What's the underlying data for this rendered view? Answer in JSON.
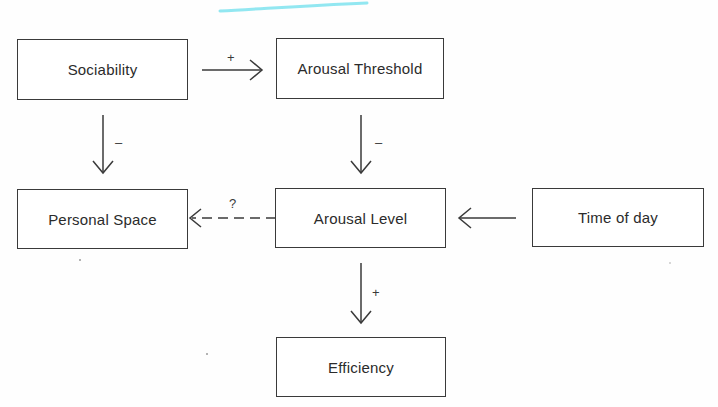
{
  "diagram": {
    "nodes": {
      "sociability": "Sociability",
      "arousal_threshold": "Arousal Threshold",
      "personal_space": "Personal Space",
      "arousal_level": "Arousal Level",
      "time_of_day": "Time of day",
      "efficiency": "Efficiency"
    },
    "edges": [
      {
        "from": "Sociability",
        "to": "Arousal Threshold",
        "label": "+",
        "style": "solid"
      },
      {
        "from": "Sociability",
        "to": "Personal Space",
        "label": "–",
        "style": "solid"
      },
      {
        "from": "Arousal Threshold",
        "to": "Arousal Level",
        "label": "–",
        "style": "solid"
      },
      {
        "from": "Arousal Level",
        "to": "Personal Space",
        "label": "?",
        "style": "dashed"
      },
      {
        "from": "Time of day",
        "to": "Arousal Level",
        "label": "",
        "style": "solid"
      },
      {
        "from": "Arousal Level",
        "to": "Efficiency",
        "label": "+",
        "style": "solid"
      }
    ],
    "labels": {
      "sociability_to_threshold": "+",
      "sociability_to_personal_space": "–",
      "threshold_to_level": "–",
      "level_to_personal_space": "?",
      "level_to_efficiency": "+"
    },
    "colors": {
      "stroke": "#3a3a3a",
      "highlight": "#7fe3ee"
    }
  }
}
